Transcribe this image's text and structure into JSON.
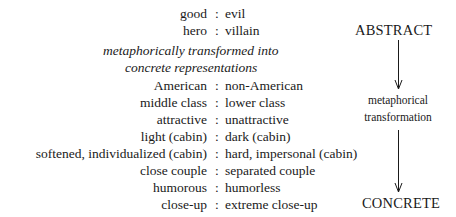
{
  "abstract_pairs": [
    {
      "left": "good",
      "sep": ":",
      "right": "evil"
    },
    {
      "left": "hero",
      "sep": ":",
      "right": "villain"
    }
  ],
  "transition_text": {
    "line1": "metaphorically transformed into",
    "line2": "concrete representations"
  },
  "concrete_pairs": [
    {
      "left": "American",
      "sep": ":",
      "right": "non-American"
    },
    {
      "left": "middle class",
      "sep": ":",
      "right": "lower class"
    },
    {
      "left": "attractive",
      "sep": ":",
      "right": "unattractive"
    },
    {
      "left": "light (cabin)",
      "sep": ":",
      "right": "dark (cabin)"
    },
    {
      "left": "softened, individualized (cabin)",
      "sep": ":",
      "right": "hard, impersonal (cabin)"
    },
    {
      "left": "close couple",
      "sep": ":",
      "right": "separated couple"
    },
    {
      "left": "humorous",
      "sep": ":",
      "right": "humorless"
    },
    {
      "left": "close-up",
      "sep": ":",
      "right": "extreme close-up"
    }
  ],
  "axis": {
    "top_label": "ABSTRACT",
    "middle_label_line1": "metaphorical",
    "middle_label_line2": "transformation",
    "bottom_label": "CONCRETE"
  },
  "colors": {
    "text": "#1a1a1a",
    "background": "#ffffff"
  }
}
